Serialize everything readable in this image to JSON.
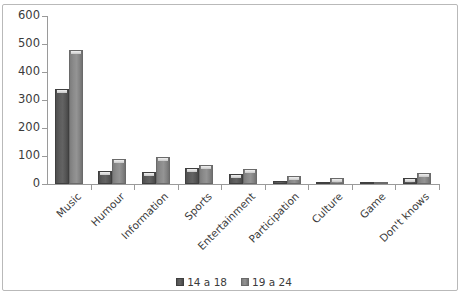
{
  "chart_data": {
    "type": "bar",
    "title": "",
    "subtitle": "",
    "xlabel": "",
    "ylabel": "",
    "ylim": [
      0,
      600
    ],
    "ytick_step": 100,
    "yticks": [
      "0",
      "100",
      "200",
      "300",
      "400",
      "500",
      "600"
    ],
    "grid": false,
    "legend_position": "bottom",
    "categories": [
      "Music",
      "Humour",
      "Information",
      "Sports",
      "Entertainment",
      "Participation",
      "Culture",
      "Game",
      "Don't knows"
    ],
    "series": [
      {
        "name": "14 a 18",
        "color": "#595959",
        "values": [
          338,
          47,
          42,
          58,
          36,
          12,
          5,
          3,
          22
        ]
      },
      {
        "name": "19 a 24",
        "color": "#8c8c8c",
        "values": [
          480,
          90,
          98,
          68,
          54,
          28,
          22,
          6,
          38
        ]
      }
    ]
  },
  "legend": {
    "entries": [
      {
        "label": "14 a 18"
      },
      {
        "label": "19 a 24"
      }
    ]
  },
  "colors": {
    "series_1": "#595959",
    "series_2": "#8c8c8c",
    "axis": "#9a9a9a",
    "text": "#3b3b3b",
    "border": "#b9b9b9",
    "background": "#ffffff"
  }
}
